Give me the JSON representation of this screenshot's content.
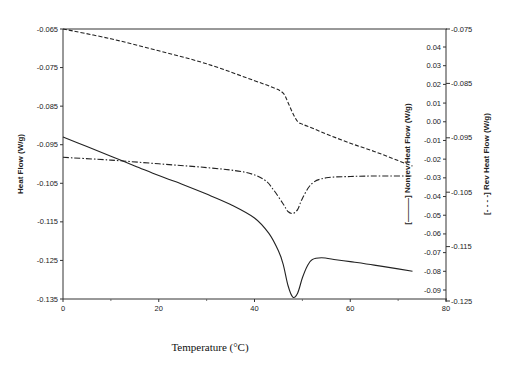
{
  "chart_data": {
    "type": "line",
    "title": "",
    "xlabel": "Temperature (°C)",
    "ylabel": "Heat Flow (W/g)",
    "y2label": "[———] Nonrev Heat Flow (W/g)",
    "y3label": "[- - - -] Rev Heat Flow (W/g)",
    "xlim": [
      0,
      80
    ],
    "ylim": [
      -0.135,
      -0.065
    ],
    "y2lim": [
      -0.09,
      0.04
    ],
    "y3lim": [
      -0.125,
      -0.075
    ],
    "grid": false,
    "x_ticks": [
      "0",
      "20",
      "40",
      "60",
      "80"
    ],
    "y_ticks": [
      "-0.065",
      "-0.075",
      "-0.085",
      "-0.095",
      "-0.105",
      "-0.115",
      "-0.125",
      "-0.135"
    ],
    "y2_ticks": [
      "0.04",
      "0.03",
      "0.02",
      "0.01",
      "0.00",
      "-0.01",
      "-0.02",
      "-0.03",
      "-0.04",
      "-0.05",
      "-0.06",
      "-0.07",
      "-0.08",
      "-0.09"
    ],
    "y3_ticks": [
      "-0.075",
      "-0.085",
      "-0.095",
      "-0.105",
      "-0.115",
      "-0.125"
    ],
    "series": [
      {
        "name": "Heat Flow",
        "axis": "left",
        "style": "solid",
        "x": [
          0,
          5,
          10,
          15,
          20,
          25,
          30,
          35,
          40,
          43,
          45,
          46,
          47,
          48,
          49,
          50,
          51,
          52,
          54,
          57,
          60,
          65,
          70,
          73
        ],
        "values": [
          -0.093,
          -0.0955,
          -0.098,
          -0.1005,
          -0.103,
          -0.1053,
          -0.1078,
          -0.1105,
          -0.114,
          -0.118,
          -0.1225,
          -0.126,
          -0.1315,
          -0.1345,
          -0.1335,
          -0.1295,
          -0.1265,
          -0.1248,
          -0.1243,
          -0.1248,
          -0.1253,
          -0.1262,
          -0.1272,
          -0.1278
        ]
      },
      {
        "name": "Nonrev Heat Flow",
        "axis": "right-inner",
        "style": "dash-dot",
        "x": [
          0,
          10,
          20,
          30,
          38,
          42,
          44,
          46,
          47,
          48,
          49,
          50,
          52,
          55,
          60,
          65,
          70,
          73
        ],
        "values": [
          -0.019,
          -0.0205,
          -0.0225,
          -0.0245,
          -0.027,
          -0.031,
          -0.0365,
          -0.044,
          -0.048,
          -0.049,
          -0.047,
          -0.041,
          -0.033,
          -0.03,
          -0.0293,
          -0.029,
          -0.029,
          -0.029
        ]
      },
      {
        "name": "Rev Heat Flow",
        "axis": "right-outer",
        "style": "dashed",
        "x": [
          0,
          10,
          20,
          30,
          40,
          44,
          46,
          47,
          48,
          49,
          50,
          52,
          55,
          60,
          65,
          70,
          73
        ],
        "values": [
          -0.075,
          -0.0768,
          -0.079,
          -0.0814,
          -0.0845,
          -0.0858,
          -0.0868,
          -0.0885,
          -0.0905,
          -0.092,
          -0.0925,
          -0.0932,
          -0.0943,
          -0.096,
          -0.0975,
          -0.0992,
          -0.1002
        ]
      }
    ]
  }
}
